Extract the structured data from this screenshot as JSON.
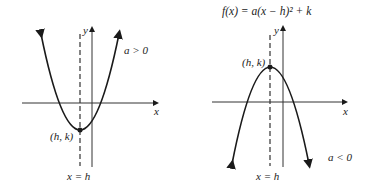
{
  "formula": "f(x) = a(x − h)² + k",
  "left_graph": {
    "case_label": "a > 0",
    "vertex_label": "(h, k)",
    "axis_of_symmetry_label": "x = h",
    "x_axis_label": "x",
    "y_axis_label": "y",
    "opens": "up"
  },
  "right_graph": {
    "case_label": "a < 0",
    "vertex_label": "(h, k)",
    "axis_of_symmetry_label": "x = h",
    "x_axis_label": "x",
    "y_axis_label": "y",
    "opens": "down"
  },
  "colors": {
    "curve": "#1a1a1a",
    "axes": "#333333",
    "background": "#ffffff"
  }
}
